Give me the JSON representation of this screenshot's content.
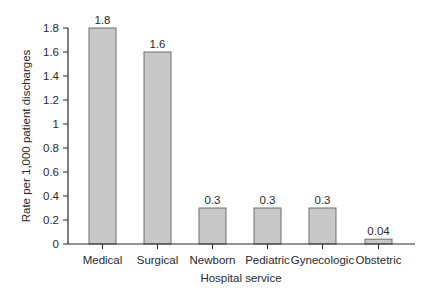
{
  "chart_data": {
    "type": "bar",
    "title": "",
    "xlabel": "Hospital service",
    "ylabel": "Rate per 1,000 patient discharges",
    "categories": [
      "Medical",
      "Surgical",
      "Newborn",
      "Pediatric",
      "Gynecologic",
      "Obstetric"
    ],
    "values": [
      1.8,
      1.6,
      0.3,
      0.3,
      0.3,
      0.04
    ],
    "value_labels": [
      "1.8",
      "1.6",
      "0.3",
      "0.3",
      "0.3",
      "0.04"
    ],
    "ylim": [
      0,
      1.8
    ],
    "yticks": [
      0,
      0.2,
      0.4,
      0.6,
      0.8,
      1,
      1.2,
      1.4,
      1.6,
      1.8
    ],
    "ytick_labels": [
      "0",
      "0.2",
      "0.4",
      "0.6",
      "0.8",
      "1",
      "1.2",
      "1.4",
      "1.6",
      "1.8"
    ],
    "grid": false,
    "legend": null,
    "colors": {
      "bar_fill": "#c8c8c8",
      "bar_stroke": "#6e6e6e",
      "axis": "#2a2a2a"
    }
  }
}
